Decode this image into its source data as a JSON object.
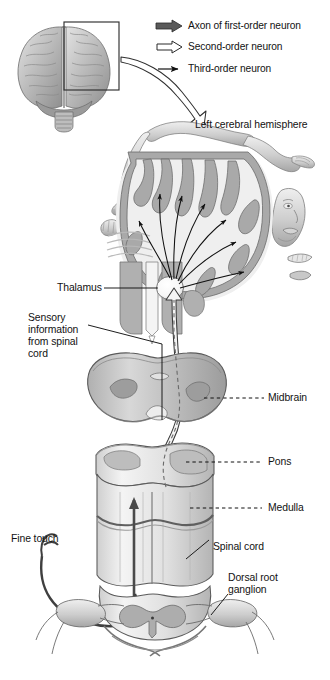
{
  "figure": {
    "type": "anatomical-diagram"
  },
  "legend": {
    "items": [
      {
        "id": "first-order",
        "label": "Axon of first-order neuron",
        "glyph": "filled-block-arrow",
        "color": "#5a5a5a"
      },
      {
        "id": "second-order",
        "label": "Second-order neuron",
        "glyph": "hollow-block-arrow",
        "color": "#ffffff"
      },
      {
        "id": "third-order",
        "label": "Third-order neuron",
        "glyph": "thin-line-arrow",
        "color": "#111111"
      }
    ]
  },
  "inset": {
    "name": "brain-photo-anterior-view",
    "callout_box": "rectangle-over-left-hemisphere",
    "zoom_arrow": "curved-hollow-arrow"
  },
  "labels": {
    "cerebral_hemisphere": "Left cerebral hemisphere",
    "thalamus": "Thalamus",
    "sensory_information": "Sensory\ninformation\nfrom spinal\ncord",
    "midbrain": "Midbrain",
    "pons": "Pons",
    "medulla": "Medulla",
    "fine_touch": "Fine touch",
    "spinal_cord": "Spinal cord",
    "dorsal_root_ganglion": "Dorsal root\nganglion"
  },
  "structures": {
    "cortex_section": "coronal-section-with-sensory-homunculus",
    "homunculus_parts": [
      "leg",
      "foot",
      "toes",
      "trunk",
      "arm",
      "hand",
      "fingers",
      "face",
      "teeth",
      "tongue"
    ],
    "thalamic_radiations": 7,
    "decussation": "medulla"
  },
  "colors": {
    "gray_matter": "#a9a9a9",
    "white_matter": "#e8e8e8",
    "outline": "#4a4a4a",
    "tract_fill": "#f2f2f2",
    "first_order_axon": "#4a4a4a",
    "text": "#121212"
  }
}
